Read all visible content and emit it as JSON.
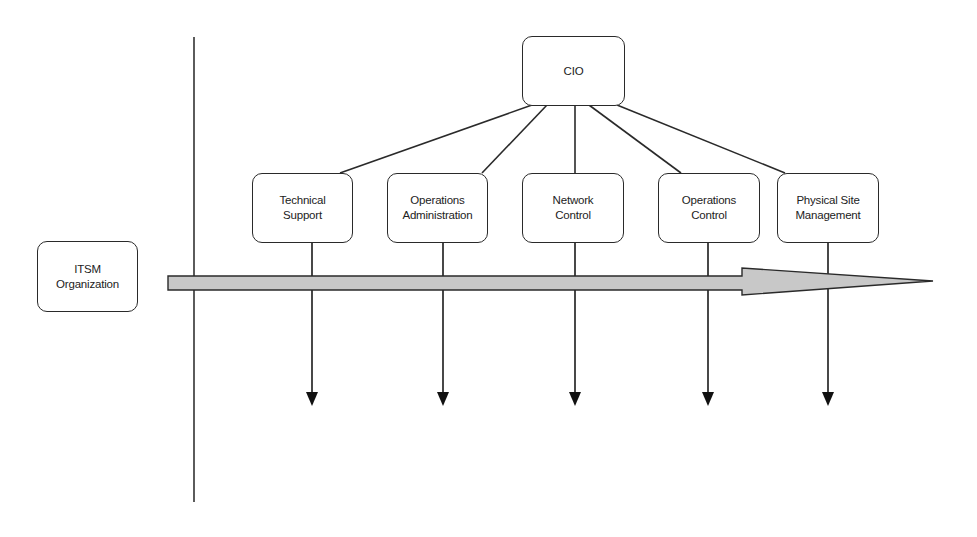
{
  "diagram": {
    "root": {
      "id": "cio",
      "label": "CIO"
    },
    "left_label": {
      "id": "itsm",
      "label": "ITSM\nOrganization"
    },
    "departments": [
      {
        "id": "technical-support",
        "label": "Technical\nSupport"
      },
      {
        "id": "operations-administration",
        "label": "Operations\nAdministration"
      },
      {
        "id": "network-control",
        "label": "Network\nControl"
      },
      {
        "id": "operations-control",
        "label": "Operations\nControl"
      },
      {
        "id": "physical-site-management",
        "label": "Physical Site\nManagement"
      }
    ],
    "edges": [
      {
        "from": "cio",
        "to": "technical-support"
      },
      {
        "from": "cio",
        "to": "operations-administration"
      },
      {
        "from": "cio",
        "to": "network-control"
      },
      {
        "from": "cio",
        "to": "operations-control"
      },
      {
        "from": "cio",
        "to": "physical-site-management"
      }
    ],
    "flow_arrow": {
      "direction": "right",
      "fill": "#c8c8c8"
    }
  }
}
